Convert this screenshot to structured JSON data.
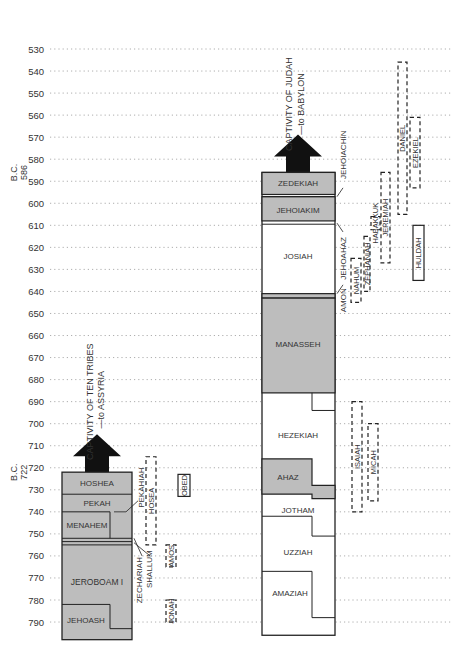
{
  "chart_data": {
    "type": "timeline",
    "title": "",
    "ylabel": "Years B.C.",
    "ylim": [
      530,
      790
    ],
    "tick_labels": [
      "530",
      "540",
      "550",
      "560",
      "570",
      "580",
      "590",
      "600",
      "610",
      "620",
      "630",
      "640",
      "650",
      "660",
      "670",
      "680",
      "690",
      "700",
      "710",
      "720",
      "730",
      "740",
      "750",
      "760",
      "770",
      "780",
      "790"
    ],
    "axis_markers": [
      {
        "label": "B.C.",
        "year_label": "586",
        "year": 586
      },
      {
        "label": "B.C.",
        "year_label": "722",
        "year": 722
      }
    ],
    "israel": {
      "captivity": {
        "line1": "CAPTIVITY OF TEN TRIBES",
        "line2": "—to ASSYRIA",
        "year": 722
      },
      "kings": [
        {
          "name": "HOSHEA",
          "start": 732,
          "end": 722,
          "shaded": true
        },
        {
          "name": "PEKAH",
          "start": 740,
          "end": 732,
          "shaded": true
        },
        {
          "name": "PEKAHIAH",
          "start": 742,
          "end": 740,
          "shaded": true,
          "callout": true
        },
        {
          "name": "MENAHEM",
          "start": 752,
          "end": 742,
          "shaded": true
        },
        {
          "name": "SHALLUM",
          "start": 752,
          "end": 752,
          "shaded": true,
          "callout": true
        },
        {
          "name": "ZECHARIAH",
          "start": 753,
          "end": 752,
          "shaded": true,
          "callout": true
        },
        {
          "name": "JEROBOAM I",
          "start": 793,
          "end": 753,
          "shaded": true
        },
        {
          "name": "JEHOASH",
          "start": 798,
          "end": 782,
          "shaded": true
        }
      ],
      "prophets": [
        {
          "name": "HOSEA",
          "start": 755,
          "end": 715,
          "style": "dashed"
        },
        {
          "name": "AMOS",
          "start": 765,
          "end": 755,
          "style": "dashed"
        },
        {
          "name": "JONAH",
          "start": 790,
          "end": 780,
          "style": "dashed"
        },
        {
          "name": "OBED",
          "start": 733,
          "end": 723,
          "style": "solid"
        }
      ]
    },
    "judah": {
      "captivity": {
        "line1": "CAPTIVITY OF JUDAH",
        "line2": "—to BABYLON",
        "year": 586
      },
      "kings": [
        {
          "name": "ZEDEKIAH",
          "start": 597,
          "end": 586,
          "shaded": true
        },
        {
          "name": "JEHOIACHIN",
          "start": 597,
          "end": 597,
          "shaded": true,
          "callout": true
        },
        {
          "name": "JEHOIAKIM",
          "start": 609,
          "end": 598,
          "shaded": true
        },
        {
          "name": "JEHOAHAZ",
          "start": 609,
          "end": 609,
          "shaded": true,
          "callout": true
        },
        {
          "name": "JOSIAH",
          "start": 640,
          "end": 609,
          "shaded": false
        },
        {
          "name": "AMON",
          "start": 642,
          "end": 640,
          "shaded": true,
          "callout": true
        },
        {
          "name": "MANASSEH",
          "start": 697,
          "end": 642,
          "shaded": true
        },
        {
          "name": "HEZEKIAH",
          "start": 716,
          "end": 687,
          "shaded": false
        },
        {
          "name": "AHAZ",
          "start": 735,
          "end": 715,
          "shaded": true
        },
        {
          "name": "JOTHAM",
          "start": 750,
          "end": 732,
          "shaded": false
        },
        {
          "name": "UZZIAH",
          "start": 791,
          "end": 740,
          "shaded": false
        },
        {
          "name": "AMAZIAH",
          "start": 796,
          "end": 767,
          "shaded": false
        }
      ],
      "prophets": [
        {
          "name": "DANIEL",
          "start": 605,
          "end": 536,
          "style": "dashed"
        },
        {
          "name": "EZEKIEL",
          "start": 593,
          "end": 561,
          "style": "dashed"
        },
        {
          "name": "JEREMIAH",
          "start": 627,
          "end": 586,
          "style": "dashed"
        },
        {
          "name": "HABAKKUK",
          "start": 612,
          "end": 606,
          "style": "dashed"
        },
        {
          "name": "ZEPHANIAH",
          "start": 640,
          "end": 615,
          "style": "dashed"
        },
        {
          "name": "NAHUM",
          "start": 645,
          "end": 625,
          "style": "dashed"
        },
        {
          "name": "ISAIAH",
          "start": 740,
          "end": 690,
          "style": "dashed"
        },
        {
          "name": "MICAH",
          "start": 735,
          "end": 700,
          "style": "dashed"
        },
        {
          "name": "HULDAH",
          "start": 635,
          "end": 610,
          "style": "solid"
        }
      ]
    }
  }
}
